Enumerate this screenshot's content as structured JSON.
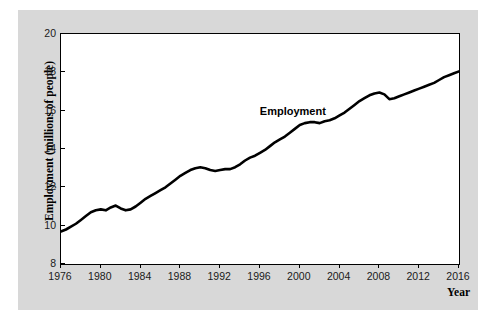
{
  "chart_data": {
    "type": "line",
    "title": "",
    "xlabel": "Year",
    "ylabel": "Employment (millions of people)",
    "xlim": [
      1976,
      2016
    ],
    "ylim": [
      8,
      20
    ],
    "grid": false,
    "legend_position": "inline-annotation",
    "xticks": [
      1976,
      1980,
      1984,
      1988,
      1992,
      1996,
      2000,
      2004,
      2008,
      2012,
      2016
    ],
    "yticks": [
      8,
      10,
      12,
      14,
      16,
      18,
      20
    ],
    "annotations": [
      {
        "text": "Employment",
        "x": 1999.5,
        "y": 15.9
      }
    ],
    "series": [
      {
        "name": "Employment",
        "color": "#000000",
        "x": [
          1976.0,
          1976.5,
          1977.0,
          1977.5,
          1978.0,
          1978.5,
          1979.0,
          1979.5,
          1980.0,
          1980.5,
          1981.0,
          1981.5,
          1982.0,
          1982.5,
          1983.0,
          1983.5,
          1984.0,
          1984.5,
          1985.0,
          1985.5,
          1986.0,
          1986.5,
          1987.0,
          1987.5,
          1988.0,
          1988.5,
          1989.0,
          1989.5,
          1990.0,
          1990.5,
          1991.0,
          1991.5,
          1992.0,
          1992.5,
          1993.0,
          1993.5,
          1994.0,
          1994.5,
          1995.0,
          1995.5,
          1996.0,
          1996.5,
          1997.0,
          1997.5,
          1998.0,
          1998.5,
          1999.0,
          1999.5,
          2000.0,
          2000.5,
          2001.0,
          2001.5,
          2002.0,
          2002.5,
          2003.0,
          2003.5,
          2004.0,
          2004.5,
          2005.0,
          2005.5,
          2006.0,
          2006.5,
          2007.0,
          2007.5,
          2008.0,
          2008.5,
          2009.0,
          2009.5,
          2010.0,
          2010.5,
          2011.0,
          2011.5,
          2012.0,
          2012.5,
          2013.0,
          2013.5,
          2014.0,
          2014.5,
          2015.0,
          2015.5,
          2016.0
        ],
        "values": [
          9.7,
          9.8,
          9.95,
          10.1,
          10.3,
          10.5,
          10.7,
          10.8,
          10.85,
          10.8,
          10.95,
          11.05,
          10.9,
          10.8,
          10.85,
          11.0,
          11.2,
          11.4,
          11.55,
          11.7,
          11.85,
          12.0,
          12.2,
          12.4,
          12.6,
          12.75,
          12.9,
          13.0,
          13.05,
          13.0,
          12.9,
          12.85,
          12.9,
          12.95,
          12.95,
          13.05,
          13.2,
          13.4,
          13.55,
          13.65,
          13.8,
          13.95,
          14.15,
          14.35,
          14.5,
          14.65,
          14.85,
          15.05,
          15.25,
          15.35,
          15.4,
          15.4,
          15.35,
          15.45,
          15.5,
          15.6,
          15.75,
          15.9,
          16.1,
          16.3,
          16.5,
          16.65,
          16.8,
          16.9,
          16.95,
          16.85,
          16.6,
          16.65,
          16.75,
          16.85,
          16.95,
          17.05,
          17.15,
          17.25,
          17.35,
          17.45,
          17.6,
          17.75,
          17.85,
          17.95,
          18.05
        ]
      }
    ]
  },
  "axis": {
    "y_title": "Employment (millions of people)",
    "x_title": "Year",
    "y_labels": [
      "20",
      "18",
      "16",
      "14",
      "12",
      "10",
      "8"
    ],
    "x_labels": [
      "1976",
      "1980",
      "1984",
      "1988",
      "1992",
      "1996",
      "2000",
      "2004",
      "2008",
      "2012",
      "2016"
    ]
  },
  "annotation": {
    "employment_label": "Employment"
  },
  "colors": {
    "figure_background": "#d8d8d8",
    "plot_background": "#ffffff",
    "line": "#000000",
    "frame": "#000000"
  }
}
